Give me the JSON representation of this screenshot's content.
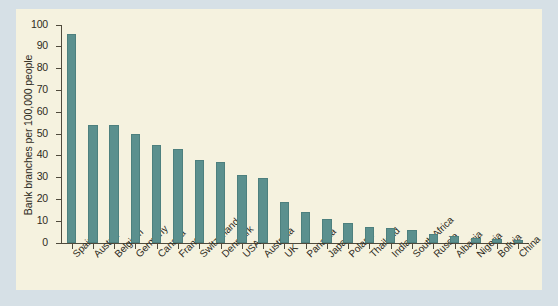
{
  "chart_data": {
    "type": "bar",
    "title": "",
    "xlabel": "",
    "ylabel": "Bank branches per 100,000 people",
    "ylim": [
      0,
      100
    ],
    "yticks": [
      0,
      10,
      20,
      30,
      40,
      50,
      60,
      70,
      80,
      90,
      100
    ],
    "grid": false,
    "legend": false,
    "bar_color": "#5b908e",
    "plot_background": "#f5f2df",
    "figure_background": "#d6e0e6",
    "axis_color": "#4f4a3c",
    "categories": [
      "Spain",
      "Austria",
      "Belgium",
      "Germany",
      "Canada",
      "France",
      "Switzerland",
      "Denmark",
      "USA",
      "Australia",
      "UK",
      "Panama",
      "Japan",
      "Poland",
      "Thailand",
      "India",
      "South Africa",
      "Russia",
      "Albania",
      "Nigeria",
      "Bolivia",
      "China"
    ],
    "values": [
      96,
      54,
      54,
      50,
      45,
      43,
      38,
      37,
      31,
      30,
      19,
      14,
      11,
      9,
      7.5,
      7,
      6,
      4,
      3,
      2.5,
      2,
      1.5
    ]
  }
}
